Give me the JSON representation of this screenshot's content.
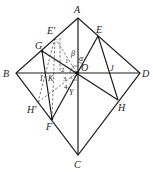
{
  "diagram": {
    "type": "geometry",
    "points": {
      "A": {
        "label": "A",
        "x": 78,
        "y": 18
      },
      "B": {
        "label": "B",
        "x": 16,
        "y": 73
      },
      "C": {
        "label": "C",
        "x": 78,
        "y": 155
      },
      "D": {
        "label": "D",
        "x": 140,
        "y": 73
      },
      "O": {
        "label": "O",
        "x": 77,
        "y": 73
      },
      "E": {
        "label": "E",
        "x": 98,
        "y": 36
      },
      "E_prime": {
        "label": "E'",
        "x": 55,
        "y": 38
      },
      "G": {
        "label": "G",
        "x": 42,
        "y": 51
      },
      "H": {
        "label": "H",
        "x": 118,
        "y": 100
      },
      "H_prime": {
        "label": "H'",
        "x": 38,
        "y": 102
      },
      "F": {
        "label": "F",
        "x": 52,
        "y": 119
      },
      "I": {
        "label": "I",
        "x": 44,
        "y": 73
      },
      "K": {
        "label": "K",
        "x": 52,
        "y": 73
      },
      "J": {
        "label": "J",
        "x": 112,
        "y": 73
      },
      "Y": {
        "label": "Y",
        "x": 70,
        "y": 88
      }
    },
    "angle_labels": {
      "alpha": "α",
      "beta": "β",
      "a1": "1",
      "a2": "2",
      "a3": "3",
      "a4": "4"
    }
  }
}
